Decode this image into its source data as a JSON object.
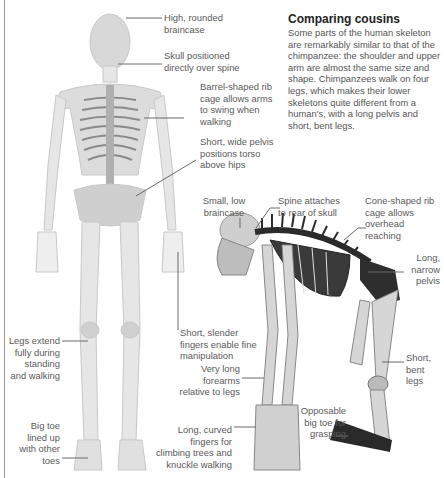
{
  "intro": {
    "title": "Comparing cousins",
    "body": "Some parts of the human skeleton are remarkably similar to that of the chimpanzee: the shoulder and upper arm are almost the same size and shape. Chimpanzees walk on four legs, which makes their lower skeletons quite different from a human's, with a long pelvis and short, bent legs."
  },
  "human_labels": {
    "braincase": "High, rounded\nbraincase",
    "skull": "Skull positioned\ndirectly over spine",
    "ribcage": "Barrel-shaped rib\ncage allows arms\nto swing when\nwalking",
    "pelvis": "Short, wide pelvis\npositions torso\nabove hips",
    "fingers": "Short, slender\nfingers enable fine\nmanipulation",
    "legs": "Legs extend\nfully during\nstanding\nand walking",
    "toe": "Big toe\nlined up\nwith other\ntoes"
  },
  "chimp_labels": {
    "braincase": "Small, low\nbraincase",
    "spine": "Spine attaches\nto rear of skull",
    "ribcage": "Cone-shaped rib\ncage allows\noverhead\nreaching",
    "pelvis": "Long,\nnarrow\npelvis",
    "legs": "Short,\nbent\nlegs",
    "forearms": "Very long\nforearms\nrelative to legs",
    "toe": "Opposable\nbig toe for\ngrasping",
    "fingers": "Long, curved\nfingers for\nclimbing trees and\nknuckle walking"
  },
  "colors": {
    "bone_human": "#d9d9d9",
    "bone_chimp": "#cfcfcf",
    "bone_dark": "#2b2b2b",
    "text": "#5a5a5a",
    "title": "#222222"
  }
}
